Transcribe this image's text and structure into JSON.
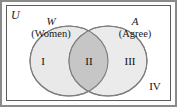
{
  "figure": {
    "type": "venn-diagram",
    "universe_label": "U",
    "sets": [
      {
        "symbol": "W",
        "name": "(Women)"
      },
      {
        "symbol": "A",
        "name": "(Agree)"
      }
    ],
    "regions": [
      {
        "id": "I",
        "label": "I",
        "meaning": "W only"
      },
      {
        "id": "II",
        "label": "II",
        "meaning": "W and A"
      },
      {
        "id": "III",
        "label": "III",
        "meaning": "A only"
      },
      {
        "id": "IV",
        "label": "IV",
        "meaning": "outside W and A"
      }
    ],
    "colors": {
      "circle_fill": "#e9e9e9",
      "intersection_fill": "#c6c6c6",
      "circle_stroke": "#7d7d7d",
      "box_border": "#5c5c5c",
      "outer_frame": "#8a8a8a",
      "background": "#ffffff",
      "text": "#111111"
    }
  }
}
